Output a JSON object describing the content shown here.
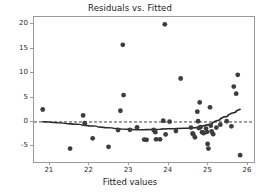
{
  "chart_data": {
    "type": "scatter",
    "title": "Residuals vs. Fitted",
    "xlabel": "Fitted values",
    "ylabel": "Residuals",
    "xlim": [
      20.6,
      26.15
    ],
    "ylim": [
      -8.2,
      21.5
    ],
    "xticks": [
      21,
      22,
      23,
      24,
      25,
      26
    ],
    "xtick_labels": [
      "21",
      "22",
      "23",
      "24",
      "25",
      "26"
    ],
    "yticks": [
      -5,
      0,
      5,
      10,
      15,
      20
    ],
    "ytick_labels": [
      "-5",
      "0",
      "5",
      "10",
      "15",
      "20"
    ],
    "grid": false,
    "legend": null,
    "marker_color": "#3d3d3d",
    "line_color": "#2b2b2b",
    "reference_line": {
      "y": 0,
      "style": "dashed",
      "color": "#2b2b2b"
    },
    "points": [
      [
        20.82,
        2.55
      ],
      [
        21.51,
        -5.45
      ],
      [
        21.84,
        1.35
      ],
      [
        21.88,
        -0.25
      ],
      [
        22.08,
        -3.35
      ],
      [
        22.48,
        -5.1
      ],
      [
        22.72,
        -1.65
      ],
      [
        22.78,
        2.3
      ],
      [
        22.84,
        15.8
      ],
      [
        22.86,
        5.5
      ],
      [
        23.02,
        -1.6
      ],
      [
        23.2,
        -1.1
      ],
      [
        23.38,
        -3.6
      ],
      [
        23.44,
        -3.65
      ],
      [
        23.62,
        -1.65
      ],
      [
        23.66,
        -2.1
      ],
      [
        23.68,
        -3.55
      ],
      [
        23.78,
        -3.55
      ],
      [
        23.86,
        0.25
      ],
      [
        23.9,
        20.0
      ],
      [
        23.92,
        -2.55
      ],
      [
        24.02,
        0.05
      ],
      [
        24.18,
        -1.85
      ],
      [
        24.3,
        8.9
      ],
      [
        24.56,
        -1.15
      ],
      [
        24.6,
        -2.35
      ],
      [
        24.62,
        -2.55
      ],
      [
        24.66,
        -3.15
      ],
      [
        24.72,
        2.1
      ],
      [
        24.74,
        0.15
      ],
      [
        24.76,
        -1.25
      ],
      [
        24.78,
        4.0
      ],
      [
        24.8,
        -1.05
      ],
      [
        24.84,
        -2.1
      ],
      [
        24.88,
        -2.3
      ],
      [
        24.94,
        -1.35
      ],
      [
        24.96,
        -2.05
      ],
      [
        24.98,
        -4.5
      ],
      [
        25.0,
        -5.45
      ],
      [
        25.04,
        3.0
      ],
      [
        25.06,
        -0.75
      ],
      [
        25.08,
        -1.95
      ],
      [
        25.12,
        -2.5
      ],
      [
        25.2,
        -1.15
      ],
      [
        25.3,
        -0.55
      ],
      [
        25.46,
        0.15
      ],
      [
        25.58,
        -0.9
      ],
      [
        25.64,
        7.25
      ],
      [
        25.7,
        5.8
      ],
      [
        25.74,
        9.65
      ],
      [
        25.8,
        -6.8
      ]
    ],
    "trend_line": {
      "name": "lowess",
      "x": [
        20.82,
        21.2,
        21.6,
        22.0,
        22.4,
        22.8,
        23.2,
        23.6,
        24.0,
        24.4,
        24.7,
        25.0,
        25.2,
        25.4,
        25.6,
        25.8
      ],
      "y": [
        0.05,
        -0.15,
        -0.45,
        -0.8,
        -1.15,
        -1.45,
        -1.6,
        -1.55,
        -1.4,
        -1.3,
        -1.15,
        -0.55,
        0.25,
        1.05,
        1.85,
        2.6
      ]
    }
  }
}
